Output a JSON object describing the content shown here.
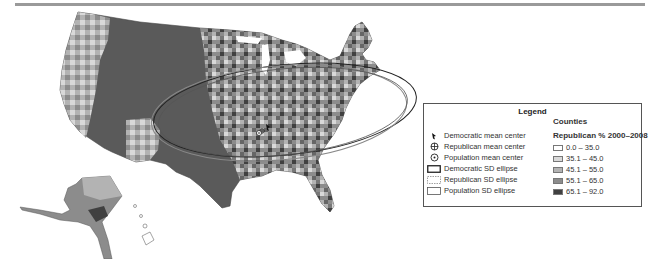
{
  "figure": {
    "top_rule": true
  },
  "map": {
    "region": "United States counties",
    "insets": [
      "Alaska",
      "Hawaii"
    ],
    "markers": [
      {
        "name": "democratic-mean-center",
        "x": 268,
        "y": 127
      },
      {
        "name": "republican-mean-center",
        "x": 262,
        "y": 131
      },
      {
        "name": "population-mean-center",
        "x": 259,
        "y": 133
      }
    ],
    "ellipses": [
      {
        "name": "democratic-sd-ellipse",
        "cx": 285,
        "cy": 110,
        "rx": 132,
        "ry": 45,
        "rotate": -6,
        "stroke": "#222222",
        "dash": ""
      },
      {
        "name": "republican-sd-ellipse",
        "cx": 279,
        "cy": 113,
        "rx": 128,
        "ry": 47,
        "rotate": -5,
        "stroke": "#888888",
        "dash": ""
      },
      {
        "name": "population-sd-ellipse",
        "cx": 283,
        "cy": 112,
        "rx": 125,
        "ry": 43,
        "rotate": -6,
        "stroke": "#555555",
        "dash": ""
      }
    ]
  },
  "legend": {
    "title": "Legend",
    "counties_title": "Counties",
    "republican_title": "Republican % 2000–2008",
    "symbols": [
      {
        "icon": "democratic-mean-center-icon",
        "label": "Democratic mean center"
      },
      {
        "icon": "republican-mean-center-icon",
        "label": "Republican mean center"
      },
      {
        "icon": "population-mean-center-icon",
        "label": "Population mean center"
      },
      {
        "icon": "democratic-sd-ellipse-icon",
        "label": "Democratic SD ellipse"
      },
      {
        "icon": "republican-sd-ellipse-icon",
        "label": "Republican SD ellipse"
      },
      {
        "icon": "population-sd-ellipse-icon",
        "label": "Population SD ellipse"
      }
    ],
    "classes": [
      {
        "label": "0.0 – 35.0",
        "color": "#ffffff"
      },
      {
        "label": "35.1 – 45.0",
        "color": "#d9d9d9"
      },
      {
        "label": "45.1 – 55.0",
        "color": "#b3b3b3"
      },
      {
        "label": "55.1 – 65.0",
        "color": "#8c8c8c"
      },
      {
        "label": "65.1 – 92.0",
        "color": "#404040"
      }
    ]
  }
}
